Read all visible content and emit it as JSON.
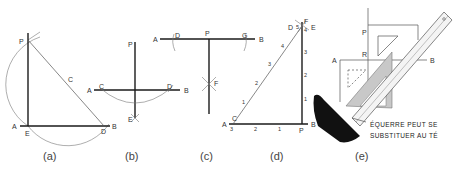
{
  "figures": {
    "a": {
      "caption": "(a)",
      "labels": {
        "P": "P",
        "C": "C",
        "A": "A",
        "E": "E",
        "D": "D",
        "B": "B"
      }
    },
    "b": {
      "caption": "(b)",
      "labels": {
        "P": "P",
        "A": "A",
        "C": "C",
        "D": "D",
        "B": "B",
        "E": "E"
      }
    },
    "c": {
      "caption": "(c)",
      "labels": {
        "A": "A",
        "D": "D",
        "P": "P",
        "G": "G",
        "B": "B",
        "F": "F"
      }
    },
    "d": {
      "caption": "(d)",
      "labels": {
        "D": "D",
        "F": "F",
        "E": "E",
        "A": "A",
        "C": "C",
        "B": "B",
        "P": "P"
      },
      "hyp_ticks": [
        "1",
        "2",
        "3",
        "4",
        "5"
      ],
      "vert_ticks": [
        "1",
        "2",
        "3",
        "4"
      ],
      "base_ticks": [
        "3",
        "2",
        "1"
      ]
    },
    "e": {
      "caption": "(e)",
      "labels": {
        "P": "P",
        "R": "R",
        "A": "A",
        "B": "B"
      },
      "note_line1": "ÉQUERRE PEUT SE",
      "note_line2": "SUBSTITUER AU TÉ"
    }
  }
}
